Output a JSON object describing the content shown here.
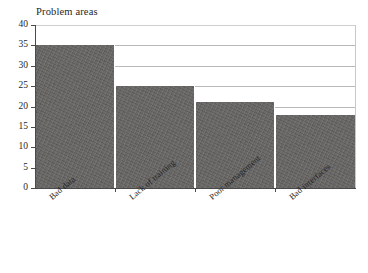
{
  "chart_data": {
    "type": "bar",
    "title": "Problem areas",
    "xlabel": "",
    "ylabel": "",
    "categories": [
      "Bad data",
      "Lack of training",
      "Poor management",
      "Bad interfaces"
    ],
    "values": [
      35,
      25,
      21,
      18
    ],
    "ylim": [
      0,
      40
    ],
    "yticks": [
      0,
      5,
      10,
      15,
      20,
      25,
      30,
      35,
      40
    ],
    "ytick_labels": [
      "0",
      "5",
      "10",
      "15",
      "20",
      "25",
      "30",
      "35",
      "40"
    ],
    "grid": true,
    "grid_axis": "y",
    "legend": false,
    "bar_color": "#666463",
    "grid_color": "#b9b9b9",
    "axis_color": "#4a4a4a",
    "background": "#ffffff",
    "xtick_label_rotation": -40
  }
}
